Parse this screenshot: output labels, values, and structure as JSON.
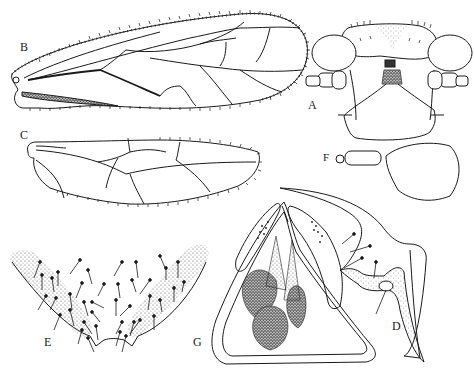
{
  "figure": {
    "type": "scientific-illustration-plate",
    "panels": [
      {
        "id": "A",
        "label": "A",
        "subject": "head, frontal view"
      },
      {
        "id": "B",
        "label": "B",
        "subject": "forewing"
      },
      {
        "id": "C",
        "label": "C",
        "subject": "hindwing"
      },
      {
        "id": "D",
        "label": "D",
        "subject": "male genitalia, lateral"
      },
      {
        "id": "E",
        "label": "E",
        "subject": "subgenital plate, setose"
      },
      {
        "id": "F",
        "label": "F",
        "subject": "antenna"
      },
      {
        "id": "G",
        "label": "G",
        "subject": "phallosome / internal structure"
      }
    ]
  },
  "colors": {
    "ink": "#1a1a1a",
    "stipple": "#9a9a9a",
    "background": "#ffffff"
  }
}
